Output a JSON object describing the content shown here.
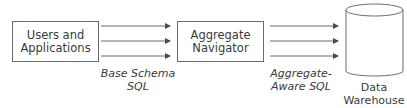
{
  "nodes": {
    "users": {
      "line1": "Users and",
      "line2": "Applications"
    },
    "navigator": {
      "line1": "Aggregate",
      "line2": "Navigator"
    },
    "warehouse": {
      "line1": "Data",
      "line2": "Warehouse"
    }
  },
  "edges": {
    "base": {
      "line1": "Base Schema",
      "line2": "SQL"
    },
    "aware": {
      "line1": "Aggregate-",
      "line2": "Aware SQL"
    }
  },
  "colors": {
    "stroke": "#6b6b6b",
    "text": "#3a3a3a"
  }
}
